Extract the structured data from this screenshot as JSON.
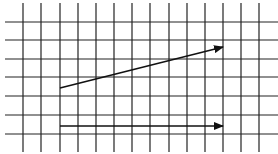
{
  "diagram": {
    "type": "grid-with-vectors",
    "background": "#ffffff",
    "grid": {
      "color": "#222222",
      "vertical_x": [
        23,
        41,
        60,
        78,
        96,
        114,
        132,
        150,
        169,
        187,
        205,
        223,
        241,
        259
      ],
      "vertical_y_range": [
        3,
        152
      ],
      "horizontal_y": [
        22,
        40,
        59,
        77,
        96,
        115,
        134
      ],
      "horizontal_x_range": [
        5,
        278
      ]
    },
    "vectors": [
      {
        "name": "sloped-vector",
        "from": [
          60,
          88
        ],
        "to": [
          223,
          47
        ],
        "color": "#111111"
      },
      {
        "name": "horizontal-vector",
        "from": [
          60,
          126
        ],
        "to": [
          223,
          126
        ],
        "color": "#111111"
      }
    ]
  }
}
